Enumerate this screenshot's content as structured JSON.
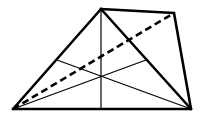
{
  "diagram": {
    "colors": {
      "stroke": "#000000",
      "background": "#ffffff"
    },
    "vertices": {
      "A": [
        13,
        109
      ],
      "B": [
        101,
        9
      ],
      "C": [
        174,
        13
      ],
      "D": [
        191,
        109
      ]
    },
    "midpoints": {
      "AB": [
        57,
        60
      ],
      "BD": [
        146,
        60
      ],
      "AD": [
        101,
        109
      ]
    },
    "centroid": [
      101,
      76
    ],
    "edges_thick": [
      [
        "A",
        "B"
      ],
      [
        "B",
        "C"
      ],
      [
        "C",
        "D"
      ],
      [
        "D",
        "A"
      ],
      [
        "B",
        "D"
      ]
    ],
    "medians_thin": [
      [
        "B",
        "AD"
      ],
      [
        "A",
        "BD"
      ],
      [
        "D",
        "AB"
      ]
    ],
    "dashed": [
      [
        "A",
        "C"
      ]
    ]
  }
}
